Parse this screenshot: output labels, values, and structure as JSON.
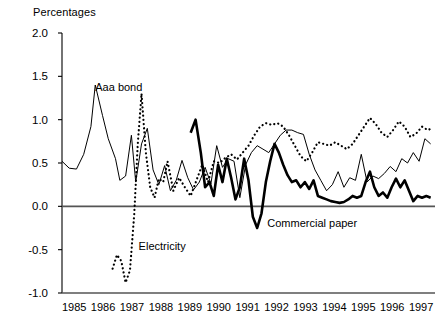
{
  "axis_title": "Percentages",
  "chart_data": {
    "type": "line",
    "title": "Percentages",
    "xlabel": "",
    "ylabel": "Percentages",
    "ylim": [
      -1.0,
      2.0
    ],
    "xlim": [
      1985.0,
      1997.9
    ],
    "yticks": [
      "2.0",
      "1.5",
      "1.0",
      "0.5",
      "0.0",
      "-0.5",
      "-1.0"
    ],
    "ytick_values": [
      2.0,
      1.5,
      1.0,
      0.5,
      0.0,
      -0.5,
      -1.0
    ],
    "categories": [
      "1985",
      "1986",
      "1987",
      "1988",
      "1989",
      "1990",
      "1991",
      "1992",
      "1993",
      "1994",
      "1995",
      "1996",
      "1997"
    ],
    "grid": false,
    "legend": "inline-annotations",
    "annotations": [
      {
        "text": "Aaa bond",
        "x": 1986.15,
        "y": 1.33
      },
      {
        "text": "Electricity",
        "x": 1987.65,
        "y": -0.5
      },
      {
        "text": "Commercial paper",
        "x": 1992.1,
        "y": -0.24
      }
    ],
    "series": [
      {
        "name": "Aaa bond",
        "style": "thin-solid",
        "x": [
          1985.0,
          1985.25,
          1985.5,
          1985.75,
          1986.0,
          1986.15,
          1986.4,
          1986.6,
          1986.85,
          1987.0,
          1987.2,
          1987.4,
          1987.55,
          1987.75,
          1987.95,
          1988.15,
          1988.35,
          1988.55,
          1988.75,
          1988.95,
          1989.15,
          1989.35,
          1989.55,
          1989.75,
          1989.95,
          1990.15,
          1990.35,
          1990.55,
          1990.75,
          1990.95,
          1991.15,
          1991.35,
          1991.55,
          1991.75,
          1991.95,
          1992.15,
          1992.35,
          1992.55,
          1992.75,
          1992.95,
          1993.15,
          1993.35,
          1993.55,
          1993.75,
          1993.95,
          1994.15,
          1994.35,
          1994.55,
          1994.75,
          1994.95,
          1995.15,
          1995.35,
          1995.55,
          1995.75,
          1995.95,
          1996.15,
          1996.35,
          1996.55,
          1996.75,
          1996.95,
          1997.15,
          1997.35,
          1997.55,
          1997.75
        ],
        "y": [
          0.52,
          0.44,
          0.43,
          0.6,
          0.92,
          1.4,
          1.05,
          0.78,
          0.55,
          0.3,
          0.35,
          0.82,
          0.28,
          0.72,
          0.9,
          0.42,
          0.25,
          0.47,
          0.18,
          0.3,
          0.53,
          0.33,
          0.19,
          0.28,
          0.45,
          0.26,
          0.7,
          0.45,
          0.55,
          0.52,
          0.1,
          0.48,
          0.62,
          0.7,
          0.66,
          0.62,
          0.72,
          0.82,
          0.88,
          0.88,
          0.85,
          0.83,
          0.6,
          0.42,
          0.3,
          0.18,
          0.25,
          0.4,
          0.22,
          0.33,
          0.3,
          0.6,
          0.28,
          0.35,
          0.32,
          0.38,
          0.46,
          0.4,
          0.55,
          0.5,
          0.62,
          0.52,
          0.78,
          0.72
        ]
      },
      {
        "name": "Electricity",
        "style": "dotted",
        "x": [
          1986.75,
          1986.9,
          1987.05,
          1987.2,
          1987.35,
          1987.5,
          1987.62,
          1987.75,
          1987.9,
          1988.05,
          1988.2,
          1988.35,
          1988.5,
          1988.65,
          1988.85,
          1989.05,
          1989.25,
          1989.45,
          1989.65,
          1989.85,
          1990.05,
          1990.25,
          1990.45,
          1990.65,
          1990.85,
          1991.05,
          1991.25,
          1991.45,
          1991.65,
          1991.85,
          1992.05,
          1992.25,
          1992.45,
          1992.65,
          1992.85,
          1993.05,
          1993.25,
          1993.45,
          1993.65,
          1993.85,
          1994.05,
          1994.25,
          1994.45,
          1994.65,
          1994.85,
          1995.05,
          1995.25,
          1995.45,
          1995.65,
          1995.85,
          1996.05,
          1996.25,
          1996.45,
          1996.65,
          1996.85,
          1997.05,
          1997.25,
          1997.45,
          1997.65,
          1997.8
        ],
        "y": [
          -0.72,
          -0.56,
          -0.63,
          -0.88,
          -0.74,
          -0.08,
          0.72,
          1.3,
          0.62,
          0.22,
          0.1,
          0.32,
          0.28,
          0.52,
          0.18,
          0.33,
          0.22,
          0.12,
          0.3,
          0.48,
          0.28,
          0.52,
          0.5,
          0.56,
          0.6,
          0.54,
          0.62,
          0.7,
          0.82,
          0.92,
          0.96,
          0.94,
          0.96,
          0.92,
          0.82,
          0.7,
          0.58,
          0.52,
          0.62,
          0.74,
          0.72,
          0.7,
          0.74,
          0.7,
          0.66,
          0.72,
          0.82,
          0.92,
          1.02,
          0.95,
          0.85,
          0.8,
          0.88,
          0.98,
          0.92,
          0.8,
          0.84,
          0.92,
          0.88,
          0.9
        ]
      },
      {
        "name": "Commercial paper",
        "style": "thick-solid",
        "x": [
          1989.45,
          1989.62,
          1989.8,
          1989.95,
          1990.1,
          1990.25,
          1990.4,
          1990.55,
          1990.7,
          1990.85,
          1991.0,
          1991.15,
          1991.3,
          1991.45,
          1991.6,
          1991.75,
          1991.9,
          1992.05,
          1992.2,
          1992.35,
          1992.5,
          1992.65,
          1992.8,
          1992.95,
          1993.1,
          1993.25,
          1993.4,
          1993.55,
          1993.7,
          1993.85,
          1994.0,
          1994.15,
          1994.3,
          1994.45,
          1994.6,
          1994.75,
          1994.9,
          1995.05,
          1995.2,
          1995.35,
          1995.5,
          1995.65,
          1995.8,
          1995.95,
          1996.1,
          1996.25,
          1996.4,
          1996.55,
          1996.7,
          1996.85,
          1997.0,
          1997.15,
          1997.3,
          1997.45,
          1997.6,
          1997.75
        ],
        "y": [
          0.85,
          1.0,
          0.62,
          0.22,
          0.28,
          0.12,
          0.48,
          0.28,
          0.55,
          0.33,
          0.08,
          0.22,
          0.55,
          0.3,
          -0.12,
          -0.25,
          -0.08,
          0.28,
          0.52,
          0.72,
          0.62,
          0.48,
          0.36,
          0.28,
          0.3,
          0.22,
          0.28,
          0.2,
          0.3,
          0.12,
          0.1,
          0.08,
          0.06,
          0.05,
          0.04,
          0.05,
          0.08,
          0.12,
          0.1,
          0.12,
          0.28,
          0.4,
          0.22,
          0.12,
          0.16,
          0.1,
          0.22,
          0.32,
          0.22,
          0.3,
          0.18,
          0.06,
          0.12,
          0.1,
          0.12,
          0.1
        ]
      }
    ]
  }
}
